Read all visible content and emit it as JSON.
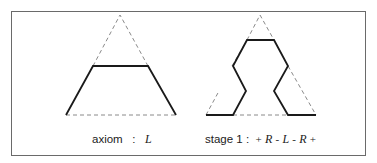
{
  "figure": {
    "panels": [
      {
        "id": "axiom",
        "caption_label": "axiom",
        "caption_sep": ":",
        "caption_formula": "L"
      },
      {
        "id": "stage1",
        "caption_label": "stage 1",
        "caption_sep": ":",
        "caption_formula_tokens": [
          "+",
          "R",
          "-",
          "L",
          "-",
          "R",
          "+"
        ]
      }
    ],
    "colors": {
      "stroke": "#1a1a1a",
      "dashed": "#8a8a8a",
      "frame": "#6a6a6a"
    }
  }
}
